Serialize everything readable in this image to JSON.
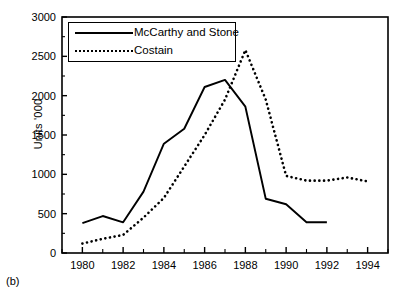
{
  "figure": {
    "panel_label": "(b)"
  },
  "chart_data": {
    "type": "line",
    "title": "",
    "xlabel": "",
    "ylabel": "Units '000",
    "xlim": [
      1979,
      1995
    ],
    "ylim": [
      0,
      3000
    ],
    "grid": false,
    "legend_position": "top-left-inside",
    "x_tick_labels": [
      "1980",
      "1982",
      "1984",
      "1986",
      "1988",
      "1990",
      "1992",
      "1994"
    ],
    "x_tick_values": [
      1980,
      1982,
      1984,
      1986,
      1988,
      1990,
      1992,
      1994
    ],
    "x_minor_tick_values": [
      1979,
      1981,
      1983,
      1985,
      1987,
      1989,
      1991,
      1993,
      1995
    ],
    "y_tick_labels": [
      "0",
      "500",
      "1000",
      "1500",
      "2000",
      "2500",
      "3000"
    ],
    "y_tick_values": [
      0,
      500,
      1000,
      1500,
      2000,
      2500,
      3000
    ],
    "series": [
      {
        "name": "McCarthy and Stone",
        "style": "solid",
        "color": "#000000",
        "x": [
          1980,
          1981,
          1982,
          1983,
          1984,
          1985,
          1986,
          1987,
          1988,
          1989,
          1990,
          1991,
          1992
        ],
        "values": [
          380,
          470,
          390,
          780,
          1390,
          1580,
          2110,
          2200,
          1860,
          690,
          620,
          390,
          390
        ]
      },
      {
        "name": "Costain",
        "style": "dotted",
        "color": "#000000",
        "x": [
          1980,
          1981,
          1982,
          1983,
          1984,
          1985,
          1986,
          1987,
          1988,
          1989,
          1990,
          1991,
          1992,
          1993,
          1994
        ],
        "values": [
          120,
          180,
          230,
          450,
          700,
          1100,
          1500,
          1950,
          2580,
          1950,
          980,
          920,
          920,
          960,
          910
        ]
      }
    ]
  }
}
